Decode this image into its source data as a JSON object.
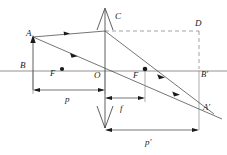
{
  "figure": {
    "type": "optics-ray-diagram",
    "canvas": {
      "width": 227,
      "height": 155,
      "background": "#ffffff"
    },
    "colors": {
      "ray": "#2b2b2b",
      "axis": "#777777",
      "dashed": "#8a8a8a",
      "dimension": "#3a3a3a",
      "label": "#1a1a1a"
    },
    "labels": {
      "object_tip": "A",
      "object_base": "B",
      "focal_left": "F",
      "center": "O",
      "focal_right": "F",
      "lens_top": "C",
      "construction_corner": "D",
      "image_base": "B'",
      "image_tip": "A'",
      "object_distance": "p",
      "focal_length": "f",
      "image_distance": "p'"
    },
    "label_positions": {
      "object_tip": {
        "x": 26,
        "y": 36
      },
      "object_base": {
        "x": 20,
        "y": 68
      },
      "focal_left": {
        "x": 50,
        "y": 76
      },
      "center": {
        "x": 94,
        "y": 77
      },
      "focal_right": {
        "x": 133,
        "y": 77
      },
      "lens_top": {
        "x": 115,
        "y": 18
      },
      "construction_corner": {
        "x": 196,
        "y": 25
      },
      "image_base": {
        "x": 201,
        "y": 76
      },
      "image_tip": {
        "x": 203,
        "y": 110
      },
      "object_distance": {
        "x": 66,
        "y": 101
      },
      "focal_length": {
        "x": 121,
        "y": 110
      },
      "image_distance": {
        "x": 147,
        "y": 147
      }
    },
    "geometry": {
      "optical_axis_y": 71,
      "optical_axis_x_start": 0,
      "optical_axis_x_end": 227,
      "lens_x": 105,
      "lens_top_y": 8,
      "lens_bottom_y": 128,
      "object_x": 33,
      "object_tip_y": 37,
      "focal_left_x": 62,
      "focal_right_x": 145,
      "image_x": 199,
      "image_tip_y": 105,
      "dashed_top_y": 31,
      "dim_p_y": 90,
      "dim_f_y": 98,
      "dim_pprime_y": 130
    },
    "dimensions": [
      {
        "name": "p",
        "from_x": 33,
        "to_x": 105,
        "y": 90
      },
      {
        "name": "f",
        "from_x": 105,
        "to_x": 145,
        "y": 98
      },
      {
        "name": "p'",
        "from_x": 105,
        "to_x": 199,
        "y": 130
      }
    ],
    "points": [
      {
        "name": "F-left-dot",
        "x": 62,
        "y": 69
      },
      {
        "name": "F-right-dot",
        "x": 145,
        "y": 69
      }
    ],
    "rays": [
      {
        "name": "parallel-ray-incoming",
        "from": [
          33,
          37
        ],
        "to": [
          105,
          31
        ]
      },
      {
        "name": "refracted-through-focus",
        "from": [
          105,
          31
        ],
        "to": [
          214,
          114
        ]
      },
      {
        "name": "chief-ray-through-center",
        "from": [
          33,
          37
        ],
        "to": [
          222,
          119
        ]
      }
    ]
  }
}
